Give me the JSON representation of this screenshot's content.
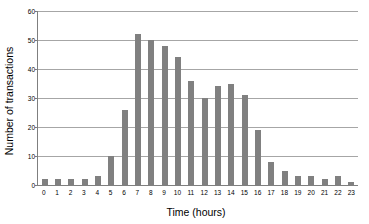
{
  "chart_data": {
    "type": "bar",
    "title": "",
    "xlabel": "Time (hours)",
    "ylabel": "Number of transactions",
    "categories": [
      "0",
      "1",
      "2",
      "3",
      "4",
      "5",
      "6",
      "7",
      "8",
      "9",
      "10",
      "11",
      "12",
      "13",
      "14",
      "15",
      "16",
      "17",
      "18",
      "19",
      "20",
      "21",
      "22",
      "23"
    ],
    "values": [
      2,
      2,
      2,
      2,
      3,
      10,
      26,
      52,
      50,
      48,
      44,
      36,
      30,
      34,
      35,
      31,
      19,
      8,
      5,
      3,
      3,
      2,
      3,
      1
    ],
    "ylim": [
      0,
      60
    ],
    "yticks": [
      0,
      10,
      20,
      30,
      40,
      50,
      60
    ],
    "ytick_labels": [
      "0",
      "10",
      "20",
      "30",
      "40",
      "50",
      "60"
    ],
    "grid": true,
    "legend": false,
    "series_name": "Number of transactions",
    "bar_color": "#808080",
    "gridline_color": "#a6a6a6",
    "axis_color": "#7f7f7f",
    "background_color": "#ffffff"
  }
}
